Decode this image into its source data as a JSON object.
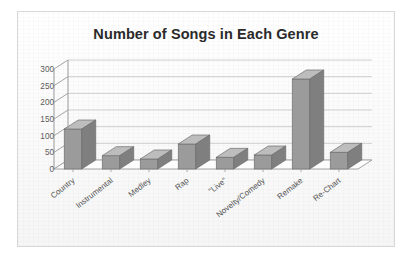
{
  "chart_data": {
    "type": "bar",
    "title": "Number of Songs in Each Genre",
    "xlabel": "",
    "ylabel": "",
    "categories": [
      "Country",
      "Instrumental",
      "Medley",
      "Rap",
      "\"Live\"",
      "Novelty/Comedy",
      "Remake",
      "Re-Chart"
    ],
    "values": [
      120,
      40,
      30,
      75,
      35,
      42,
      270,
      50
    ],
    "yticks": [
      "0",
      "50",
      "100",
      "150",
      "200",
      "250",
      "300"
    ],
    "ytick_values": [
      0,
      50,
      100,
      150,
      200,
      250,
      300
    ],
    "ylim": [
      0,
      300
    ],
    "grid": true,
    "legend": false,
    "style": "3d-column",
    "bar_color": "#9b9b9b",
    "bar_top_color": "#bdbdbd",
    "bar_side_color": "#7f7f7f",
    "grid_color": "#c9c9c9",
    "axis_color": "#9a9a9a",
    "text_color": "#555555",
    "title_color": "#2a2a2a"
  }
}
